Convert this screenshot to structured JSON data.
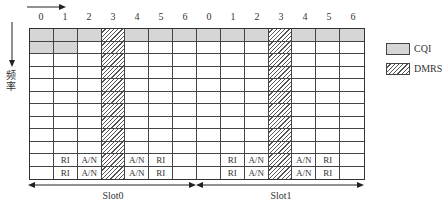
{
  "diagram": {
    "axis_labels": {
      "time_arrow": "time-arrow",
      "frequency": "频率"
    },
    "slots": [
      {
        "label": "Slot0",
        "symbols": [
          "0",
          "1",
          "2",
          "3",
          "4",
          "5",
          "6"
        ]
      },
      {
        "label": "Slot1",
        "symbols": [
          "0",
          "1",
          "2",
          "3",
          "4",
          "5",
          "6"
        ]
      }
    ],
    "rows": 12,
    "legend": [
      {
        "label": "CQI",
        "color": "#d6d6d6",
        "pattern": "solid"
      },
      {
        "label": "DMRS",
        "color": "#555555",
        "pattern": "hatched"
      }
    ],
    "cells": {
      "cqi": [
        [
          0,
          0
        ],
        [
          0,
          1
        ],
        [
          0,
          2
        ],
        [
          0,
          4
        ],
        [
          0,
          5
        ],
        [
          0,
          6
        ],
        [
          0,
          7
        ],
        [
          0,
          8
        ],
        [
          0,
          9
        ],
        [
          0,
          11
        ],
        [
          0,
          12
        ],
        [
          0,
          13
        ],
        [
          1,
          0
        ],
        [
          1,
          1
        ]
      ],
      "dmrs_columns": [
        3,
        10
      ],
      "labels": [
        {
          "row": 10,
          "col": 1,
          "text": "RI"
        },
        {
          "row": 10,
          "col": 2,
          "text": "A/N"
        },
        {
          "row": 10,
          "col": 4,
          "text": "A/N"
        },
        {
          "row": 10,
          "col": 5,
          "text": "RI"
        },
        {
          "row": 11,
          "col": 1,
          "text": "RI"
        },
        {
          "row": 11,
          "col": 2,
          "text": "A/N"
        },
        {
          "row": 11,
          "col": 4,
          "text": "A/N"
        },
        {
          "row": 11,
          "col": 5,
          "text": "RI"
        },
        {
          "row": 10,
          "col": 8,
          "text": "RI"
        },
        {
          "row": 10,
          "col": 9,
          "text": "A/N"
        },
        {
          "row": 10,
          "col": 11,
          "text": "A/N"
        },
        {
          "row": 10,
          "col": 12,
          "text": "RI"
        },
        {
          "row": 11,
          "col": 8,
          "text": "RI"
        },
        {
          "row": 11,
          "col": 9,
          "text": "A/N"
        },
        {
          "row": 11,
          "col": 11,
          "text": "A/N"
        },
        {
          "row": 11,
          "col": 12,
          "text": "RI"
        }
      ]
    }
  }
}
